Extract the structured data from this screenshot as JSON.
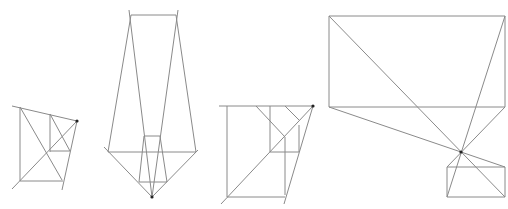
{
  "diagram": {
    "width": 508,
    "height": 209,
    "background": "#ffffff",
    "line_color": "#8a8a8a",
    "dark_line_color": "#555555",
    "point_color": "#222222",
    "figures": [
      {
        "name": "figure-1",
        "points": [
          [
            77,
            121
          ]
        ],
        "lines": [
          [
            12,
            106,
            77,
            121
          ],
          [
            20,
            107,
            20,
            181
          ],
          [
            50,
            114,
            50,
            152
          ],
          [
            20,
            181,
            63,
            181
          ],
          [
            12,
            189,
            77,
            121
          ],
          [
            77,
            121,
            62,
            190
          ],
          [
            20,
            107,
            62,
            180
          ],
          [
            50,
            151,
            70,
            151
          ],
          [
            50,
            114,
            70,
            151
          ]
        ]
      },
      {
        "name": "figure-2",
        "points": [
          [
            152,
            197
          ]
        ],
        "lines": [
          [
            131,
            15,
            176,
            15
          ],
          [
            129,
            10,
            152,
            197
          ],
          [
            178,
            10,
            152,
            197
          ],
          [
            131,
            15,
            108,
            152
          ],
          [
            176,
            15,
            196,
            152
          ],
          [
            104,
            147,
            152,
            197
          ],
          [
            198,
            150,
            152,
            197
          ],
          [
            108,
            152,
            196,
            152
          ],
          [
            144,
            136,
            160,
            136
          ],
          [
            144,
            136,
            139,
            182
          ],
          [
            160,
            136,
            167,
            182
          ],
          [
            139,
            182,
            167,
            182
          ]
        ]
      },
      {
        "name": "figure-3",
        "points": [
          [
            313,
            106
          ]
        ],
        "lines": [
          [
            219,
            106,
            313,
            106
          ],
          [
            227,
            106,
            227,
            197
          ],
          [
            227,
            197,
            285,
            197
          ],
          [
            221,
            204,
            313,
            106
          ],
          [
            313,
            106,
            284,
            204
          ],
          [
            270,
            106,
            270,
            152
          ],
          [
            270,
            152,
            299,
            152
          ],
          [
            299,
            125,
            299,
            152
          ],
          [
            256,
            106,
            285,
            137
          ],
          [
            285,
            137,
            285,
            195
          ],
          [
            285,
            106,
            299,
            120
          ]
        ]
      },
      {
        "name": "figure-4",
        "points": [
          [
            461,
            152
          ]
        ],
        "lines": [
          [
            329,
            16,
            505,
            16
          ],
          [
            329,
            16,
            329,
            107
          ],
          [
            505,
            16,
            505,
            107
          ],
          [
            329,
            107,
            505,
            107
          ],
          [
            329,
            16,
            505,
            197
          ],
          [
            505,
            16,
            447,
            197
          ],
          [
            329,
            107,
            505,
            167
          ],
          [
            505,
            107,
            447,
            167
          ],
          [
            447,
            167,
            505,
            167
          ],
          [
            447,
            167,
            447,
            197
          ],
          [
            505,
            167,
            505,
            197
          ],
          [
            447,
            197,
            505,
            197
          ]
        ]
      }
    ]
  }
}
